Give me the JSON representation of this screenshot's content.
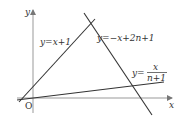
{
  "diagram": {
    "type": "coordinate-plane",
    "axes": {
      "x_label": "x",
      "y_label": "y",
      "origin_label": "O"
    },
    "lines": [
      {
        "id": "line1",
        "equation": "y=x+1",
        "label_parts": {
          "lhs": "y",
          "eq": "=",
          "rhs": "x+1"
        }
      },
      {
        "id": "line2",
        "equation": "y=-x+2n+1",
        "label_parts": {
          "lhs": "y",
          "eq": "=",
          "rhs": "−x+2n+1"
        }
      },
      {
        "id": "line3",
        "equation": "y=x/(n+1)",
        "label_parts": {
          "lhs": "y",
          "eq": "=",
          "numerator": "x",
          "denominator": "n+1"
        }
      }
    ],
    "colors": {
      "stroke": "#333333",
      "axis": "#888888",
      "background": "#ffffff"
    }
  }
}
